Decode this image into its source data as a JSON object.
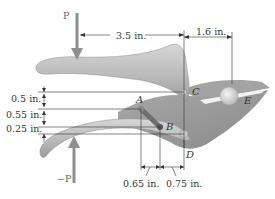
{
  "figure": {
    "forces": {
      "top": "P",
      "bottom": "−P"
    },
    "points": {
      "A": "A",
      "B": "B",
      "C": "C",
      "D": "D",
      "E": "E"
    },
    "dimensions": {
      "horizontal_top_left": "3.5 in.",
      "horizontal_top_right": "1.6 in.",
      "vertical_1": "0.5 in.",
      "vertical_2": "0.55 in.",
      "vertical_3": "0.25 in.",
      "horizontal_bottom_left": "0.65 in.",
      "horizontal_bottom_right": "0.75 in."
    },
    "colors": {
      "handle": "#b9b9b9",
      "body": "#9a9a9a",
      "link": "#6e6e6e",
      "arrow": "#8f8f8f",
      "dimension_line": "#333333"
    }
  }
}
